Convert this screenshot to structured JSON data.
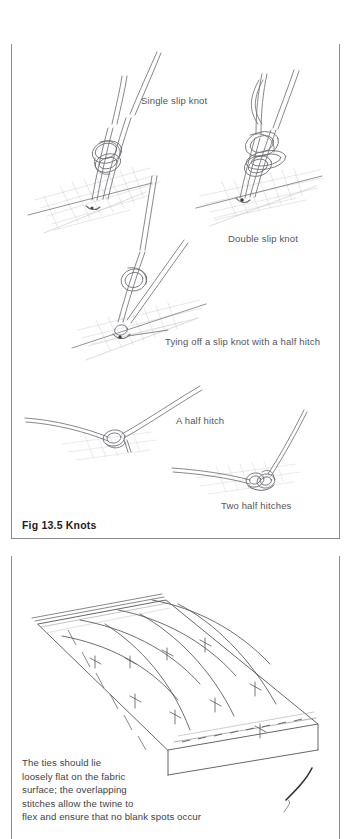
{
  "document": {
    "figure": {
      "title": "Fig 13.5 Knots",
      "labels": {
        "single_slip_knot": "Single slip knot",
        "double_slip_knot": "Double slip knot",
        "tying_off": "Tying off a slip knot with a half hitch",
        "half_hitch": "A half hitch",
        "two_half_hitches": "Two half hitches"
      }
    },
    "lower_figure": {
      "caption_lines": [
        "The ties should lie",
        "loosely flat on the fabric",
        "surface; the overlapping",
        "stitches allow the twine to",
        "flex and ensure that no blank spots occur"
      ]
    }
  },
  "colors": {
    "page_background": "#ffffff",
    "border": "#8b8b8b",
    "line_art": "#6a6a70",
    "caption_text": "#55555a",
    "title_text": "#1d1d1d",
    "shadow_hatch": "#c9c9cf"
  }
}
